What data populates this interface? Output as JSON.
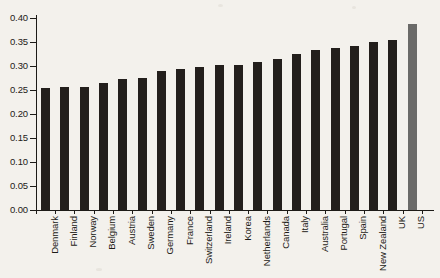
{
  "chart_data": {
    "type": "bar",
    "title": "",
    "subtitle": "",
    "xlabel": "",
    "ylabel": "",
    "ylim": [
      0.0,
      0.4
    ],
    "ytick_labels": [
      "0.00",
      "0.05",
      "0.10",
      "0.15",
      "0.20",
      "0.25",
      "0.30",
      "0.35",
      "0.40"
    ],
    "ytick_values": [
      0.0,
      0.05,
      0.1,
      0.15,
      0.2,
      0.25,
      0.3,
      0.35,
      0.4
    ],
    "grid": false,
    "legend": null,
    "categories": [
      "Denmark",
      "Finland",
      "Norway",
      "Belgium",
      "Austria",
      "Sweden",
      "Germany",
      "France",
      "Switzerland",
      "Ireland",
      "Korea",
      "Netherlands",
      "Canada",
      "Italy",
      "Australia",
      "Portugal",
      "Spain",
      "New Zealand",
      "UK",
      "US"
    ],
    "values": [
      0.255,
      0.256,
      0.257,
      0.265,
      0.273,
      0.274,
      0.289,
      0.293,
      0.297,
      0.302,
      0.303,
      0.308,
      0.315,
      0.325,
      0.334,
      0.337,
      0.342,
      0.35,
      0.354,
      0.387
    ],
    "bar_colors": [
      "#231f1c",
      "#231f1c",
      "#231f1c",
      "#231f1c",
      "#231f1c",
      "#231f1c",
      "#231f1c",
      "#231f1c",
      "#231f1c",
      "#231f1c",
      "#231f1c",
      "#231f1c",
      "#231f1c",
      "#231f1c",
      "#231f1c",
      "#231f1c",
      "#231f1c",
      "#231f1c",
      "#231f1c",
      "#6a6a68"
    ],
    "highlight_index": 19,
    "highlight_color": "#6a6a68",
    "bar_color": "#231f1c",
    "background_color": "#f3f1ec",
    "axis_color": "#1d1b17"
  }
}
